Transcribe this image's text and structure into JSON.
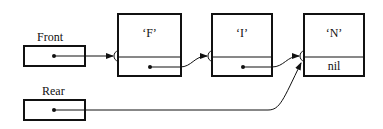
{
  "pointers": {
    "front": {
      "label": "Front"
    },
    "rear": {
      "label": "Rear"
    }
  },
  "nodes": [
    {
      "value": "‘F’",
      "next": ""
    },
    {
      "value": "‘I’",
      "next": ""
    },
    {
      "value": "‘N’",
      "next": "nil"
    }
  ]
}
